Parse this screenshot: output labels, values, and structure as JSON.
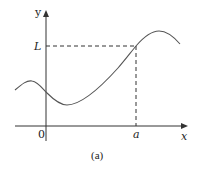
{
  "diagram": {
    "caption": "(a)",
    "axes": {
      "x_label": "x",
      "y_label": "y",
      "origin_label": "0"
    },
    "markers": {
      "x_marker_label": "a",
      "y_marker_label": "L"
    },
    "colors": {
      "ink": "#222222",
      "curve": "#555555",
      "background": "#ffffff"
    }
  }
}
